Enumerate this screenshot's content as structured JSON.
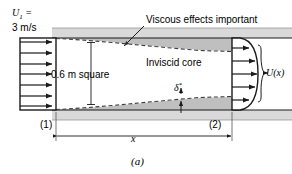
{
  "figure": {
    "caption": "(a)",
    "type": "entrance-flow-boundary-layer-duct-diagram"
  },
  "labels": {
    "inlet_velocity_symbol": "U",
    "inlet_velocity_subscript": "1",
    "inlet_velocity_equals": " =",
    "inlet_velocity_value": "3 m/s",
    "viscous_effects": "Viscous effects important",
    "inviscid_core": "Inviscid core",
    "duct_size": "0.6 m square",
    "displacement_thickness": "δ",
    "displacement_thickness_sup": "*",
    "exit_velocity": "U(x)",
    "station_1": "(1)",
    "station_2": "(2)",
    "length_dimension": "x"
  },
  "colors": {
    "ink": "#000000",
    "wall_band": "#d9d9d9",
    "boundary_layer_fill": "#bfbfbf",
    "background": "#ffffff",
    "dashed_line": "#4d4d4d"
  },
  "diagram_data": {
    "inlet_profile": {
      "shape": "uniform",
      "arrow_count": 7,
      "velocity": "3 m/s"
    },
    "exit_profile": {
      "shape": "curved-boundary-layer",
      "arrow_count": 5,
      "velocity_symbol": "U(x)"
    },
    "duct_cross_section": "0.6 m square",
    "boundary_layer_growth": "increases from station (1) to station (2)"
  }
}
